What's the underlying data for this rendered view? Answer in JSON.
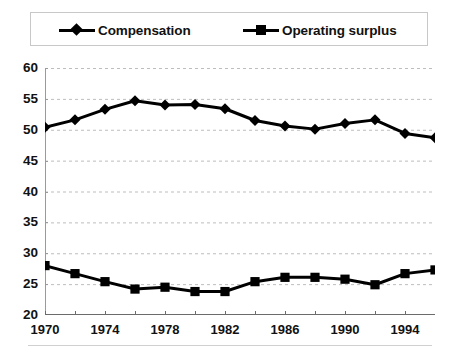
{
  "legend": {
    "position": "top",
    "entries": [
      {
        "label": "Compensation",
        "marker": "diamond-marker-icon",
        "color": "#000000"
      },
      {
        "label": "Operating surplus",
        "marker": "square-marker-icon",
        "color": "#000000"
      }
    ]
  },
  "chart_data": {
    "type": "line",
    "title": "",
    "subtitle": "",
    "xlabel": "",
    "ylabel": "",
    "xlim": [
      1970,
      1996
    ],
    "ylim": [
      20,
      60
    ],
    "grid": true,
    "grid_axis": "y",
    "legend_position": "top",
    "x": [
      1970,
      1972,
      1974,
      1976,
      1978,
      1980,
      1982,
      1984,
      1986,
      1988,
      1990,
      1992,
      1994,
      1996
    ],
    "xticks": [
      1970,
      1972,
      1974,
      1976,
      1978,
      1980,
      1982,
      1984,
      1986,
      1988,
      1990,
      1992,
      1994,
      1996
    ],
    "xtick_labels": [
      "1970",
      "",
      "1974",
      "",
      "1978",
      "",
      "1982",
      "",
      "1986",
      "",
      "1990",
      "",
      "1994",
      ""
    ],
    "xtick_labels_shown": [
      "1970",
      "1974",
      "1978",
      "1982",
      "1986",
      "1990",
      "1994"
    ],
    "yticks": [
      20,
      25,
      30,
      35,
      40,
      45,
      50,
      55,
      60
    ],
    "ytick_labels": [
      "20",
      "25",
      "30",
      "35",
      "40",
      "45",
      "50",
      "55",
      "60"
    ],
    "series": [
      {
        "name": "Compensation",
        "marker": "diamond",
        "color": "#000000",
        "values": [
          50.4,
          51.6,
          53.3,
          54.7,
          54.0,
          54.1,
          53.4,
          51.5,
          50.6,
          50.1,
          51.0,
          51.6,
          49.4,
          48.7
        ]
      },
      {
        "name": "Operating surplus",
        "marker": "square",
        "color": "#000000",
        "values": [
          28.0,
          26.7,
          25.4,
          24.2,
          24.5,
          23.8,
          23.8,
          25.4,
          26.1,
          26.1,
          25.8,
          24.9,
          26.7,
          27.3
        ]
      }
    ]
  }
}
